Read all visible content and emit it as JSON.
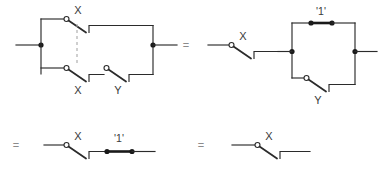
{
  "figure": {
    "kind": "switching-circuit-simplification",
    "background_color": "#ffffff",
    "wire_color": "#2b2b2b",
    "gang_line_color": "#a8a8a8",
    "label_color": "#3a3a3a",
    "equals_color": "#8c8c8c"
  },
  "labels": {
    "x_top_left": "X",
    "x_bottom_left": "X",
    "y_left": "Y",
    "x_stage2": "X",
    "one_stage2": "'1'",
    "y_stage2": "Y",
    "x_stage3": "X",
    "one_stage3": "'1'",
    "x_stage4": "X"
  },
  "operators": {
    "equals_1": "=",
    "equals_2": "=",
    "equals_3": "="
  },
  "stages": [
    {
      "id": "stage-1",
      "description": "Two parallel branches: X switch in series with open top wire, and X switch in series with Y switch; the two X switches are ganged by a dashed line.",
      "switches": [
        "X",
        "X",
        "Y"
      ],
      "topology": "parallel"
    },
    {
      "id": "stage-2",
      "description": "Single X switch in series with a parallel block of a '1' short and a Y switch.",
      "switches": [
        "X",
        "Y"
      ],
      "shorts": [
        "'1'"
      ],
      "topology": "series-parallel"
    },
    {
      "id": "stage-3",
      "description": "X switch in series with a '1' short.",
      "switches": [
        "X"
      ],
      "shorts": [
        "'1'"
      ],
      "topology": "series"
    },
    {
      "id": "stage-4",
      "description": "A single X switch.",
      "switches": [
        "X"
      ],
      "topology": "series"
    }
  ]
}
